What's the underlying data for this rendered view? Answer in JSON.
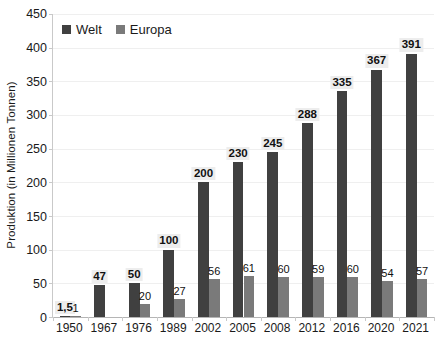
{
  "chart_data": {
    "type": "bar",
    "title": "",
    "subtitle": "",
    "xlabel": "",
    "ylabel": "Produktion (in Millionen Tonnen)",
    "ylim": [
      0,
      450
    ],
    "ytick_step": 50,
    "yticks": [
      0,
      50,
      100,
      150,
      200,
      250,
      300,
      350,
      400,
      450
    ],
    "ytick_labels": [
      "0",
      "50",
      "100",
      "150",
      "200",
      "250",
      "300",
      "350",
      "400",
      "450"
    ],
    "grid": true,
    "grid_axis": "y",
    "legend_position": "top-left-inside",
    "categories": [
      "1950",
      "1967",
      "1976",
      "1989",
      "2002",
      "2005",
      "2008",
      "2012",
      "2016",
      "2020",
      "2021"
    ],
    "series": [
      {
        "name": "Welt",
        "color": "#404040",
        "values": [
          1.5,
          47,
          50,
          100,
          200,
          230,
          245,
          288,
          335,
          367,
          391
        ],
        "labels": [
          "1,5",
          "47",
          "50",
          "100",
          "200",
          "230",
          "245",
          "288",
          "335",
          "367",
          "391"
        ]
      },
      {
        "name": "Europa",
        "color": "#7a7a7a",
        "values": [
          1,
          null,
          20,
          27,
          56,
          61,
          60,
          59,
          60,
          54,
          57
        ],
        "labels": [
          "1",
          "",
          "20",
          "27",
          "56",
          "61",
          "60",
          "59",
          "60",
          "54",
          "57"
        ]
      }
    ]
  },
  "legend": {
    "entries": [
      {
        "label": "Welt",
        "color": "#404040",
        "marker": "square-marker-icon"
      },
      {
        "label": "Europa",
        "color": "#7a7a7a",
        "marker": "square-marker-icon"
      }
    ]
  },
  "colors": {
    "welt": "#404040",
    "europa": "#7a7a7a",
    "gridline": "#efefef",
    "axis": "#b5b5b5",
    "label_background": "#ededed",
    "text": "#1a1a1a",
    "background": "#ffffff"
  }
}
